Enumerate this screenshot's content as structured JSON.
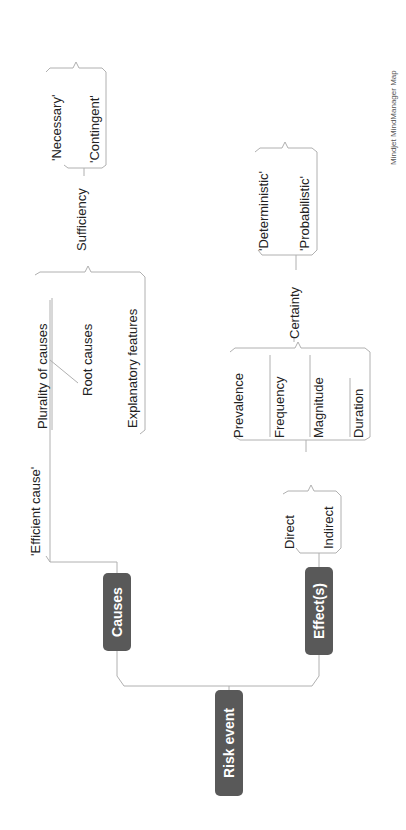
{
  "orientation": "rotated-90-ccw",
  "colors": {
    "central_box": "#595959",
    "main_box": "#595959",
    "connector": "#b0b0b0",
    "text": "#222222"
  },
  "central": {
    "label": "Risk event"
  },
  "branches": {
    "causes": {
      "label": "Causes",
      "children": {
        "efficient_cause": "'Efficient cause'",
        "plurality": "Plurality of causes",
        "root_causes": "Root causes",
        "explanatory": "Explanatory features",
        "sufficiency": {
          "label": "Sufficiency",
          "children": {
            "necessary": "'Necessary'",
            "contingent": "'Contingent'"
          }
        }
      }
    },
    "effects": {
      "label": "Effect(s)",
      "children": {
        "direct": "Direct",
        "indirect": "Indirect",
        "prevalence": "Prevalence",
        "frequency": "Frequency",
        "magnitude": "Magnitude",
        "duration": "Duration",
        "certainty": {
          "label": "Certainty",
          "children": {
            "deterministic": "'Deterministic'",
            "probabilistic": "'Probabilistic'"
          }
        }
      }
    }
  },
  "watermark": "Mindjet MindManager Map"
}
